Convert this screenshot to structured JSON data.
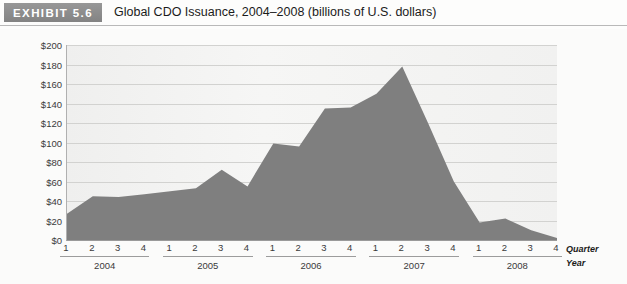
{
  "header": {
    "badge": "EXHIBIT 5.6",
    "title": "Global CDO Issuance, 2004–2008 (billions of U.S. dollars)"
  },
  "axis_legend": {
    "quarter": "Quarter",
    "year": "Year"
  },
  "colors": {
    "badge_bg": "#8d8d8d",
    "area_fill": "#7f7f7f",
    "plot_bg": "#f2f2f0",
    "gridline": "#d2d2d0",
    "axis": "#9a9a9a"
  },
  "chart_data": {
    "type": "area",
    "title": "Global CDO Issuance, 2004–2008 (billions of U.S. dollars)",
    "xlabel": "Quarter / Year",
    "ylabel": "",
    "ylim": [
      0,
      200
    ],
    "ytick_labels": [
      "$0",
      "$20",
      "$40",
      "$60",
      "$80",
      "$100",
      "$120",
      "$140",
      "$160",
      "$180",
      "$200"
    ],
    "ytick_values": [
      0,
      20,
      40,
      60,
      80,
      100,
      120,
      140,
      160,
      180,
      200
    ],
    "grid": true,
    "legend": "none",
    "quarter_labels": [
      "1",
      "2",
      "3",
      "4"
    ],
    "years": [
      "2004",
      "2005",
      "2006",
      "2007",
      "2008"
    ],
    "categories": [
      "2004 Q1",
      "2004 Q2",
      "2004 Q3",
      "2004 Q4",
      "2005 Q1",
      "2005 Q2",
      "2005 Q3",
      "2005 Q4",
      "2006 Q1",
      "2006 Q2",
      "2006 Q3",
      "2006 Q4",
      "2007 Q1",
      "2007 Q2",
      "2007 Q3",
      "2007 Q4",
      "2008 Q1",
      "2008 Q2",
      "2008 Q3",
      "2008 Q4"
    ],
    "values": [
      27,
      45,
      44,
      47,
      50,
      53,
      72,
      55,
      99,
      96,
      135,
      136,
      150,
      178,
      120,
      60,
      18,
      22,
      10,
      2
    ]
  }
}
